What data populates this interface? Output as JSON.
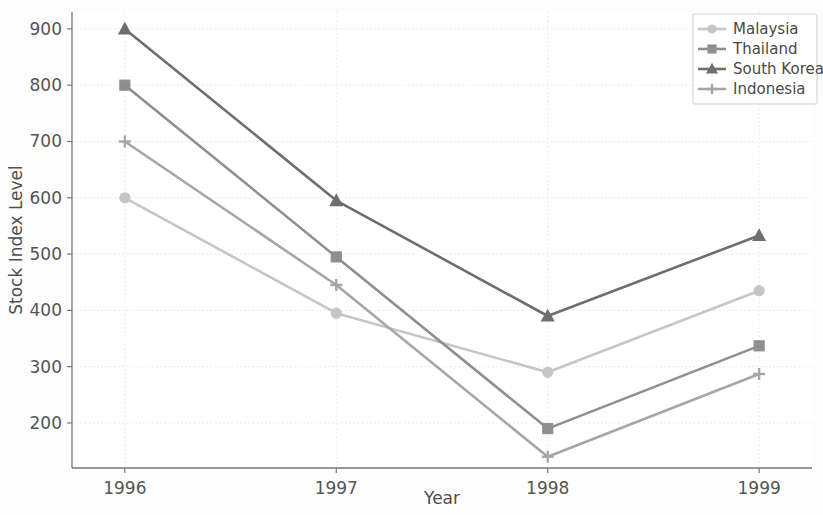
{
  "chart_data": {
    "type": "line",
    "title": "",
    "xlabel": "Year",
    "ylabel": "Stock Index Level",
    "x": [
      1996,
      1997,
      1998,
      1999
    ],
    "xtick_labels": [
      "1996",
      "1997",
      "1998",
      "1999"
    ],
    "ytick_labels": [
      "200",
      "300",
      "400",
      "500",
      "600",
      "700",
      "800",
      "900"
    ],
    "yticks": [
      200,
      300,
      400,
      500,
      600,
      700,
      800,
      900
    ],
    "xlim": [
      1995.75,
      1999.25
    ],
    "ylim": [
      120,
      930
    ],
    "grid": true,
    "legend_position": "upper right",
    "series": [
      {
        "name": "Malaysia",
        "values": [
          600,
          395,
          290,
          435
        ],
        "color": "#c6c6c6",
        "marker": "circle"
      },
      {
        "name": "Thailand",
        "values": [
          800,
          495,
          190,
          337
        ],
        "color": "#8f8f8f",
        "marker": "square"
      },
      {
        "name": "South Korea",
        "values": [
          900,
          595,
          390,
          533
        ],
        "color": "#6e6e6e",
        "marker": "triangle"
      },
      {
        "name": "Indonesia",
        "values": [
          700,
          445,
          140,
          287
        ],
        "color": "#a6a6a6",
        "marker": "plus"
      }
    ]
  },
  "legend": {
    "entries": [
      {
        "label": "Malaysia"
      },
      {
        "label": "Thailand"
      },
      {
        "label": "South Korea"
      },
      {
        "label": "Indonesia"
      }
    ]
  },
  "axes": {
    "x_axis_label": "Year",
    "y_axis_label": "Stock Index Level"
  }
}
